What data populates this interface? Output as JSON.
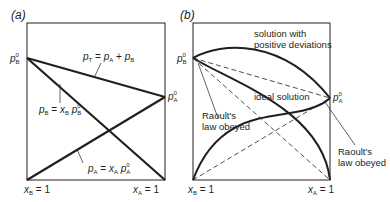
{
  "panels": [
    {
      "id": "a",
      "label": "(a)",
      "left_axis_label": {
        "symbol": "p",
        "sub": "B",
        "sup": "0"
      },
      "right_axis_label": {
        "symbol": "p",
        "sub": "A",
        "sup": "0"
      },
      "x_left_label": {
        "var": "x",
        "sub": "B",
        "rest": " = 1"
      },
      "x_right_label": {
        "var": "x",
        "sub": "A",
        "rest": " = 1"
      },
      "annotations": {
        "total": "p_T = p_A + p_B",
        "b_line": "p_B = x_B p_B^0",
        "a_line": "p_A = x_A p_A^0"
      }
    },
    {
      "id": "b",
      "label": "(b)",
      "left_axis_label": {
        "symbol": "p",
        "sub": "B",
        "sup": "0"
      },
      "right_axis_label": {
        "symbol": "p",
        "sub": "A",
        "sup": "0"
      },
      "x_left_label": {
        "var": "x",
        "sub": "B",
        "rest": " = 1"
      },
      "x_right_label": {
        "var": "x",
        "sub": "A",
        "rest": " = 1"
      },
      "annotations": {
        "positive_line1": "solution with",
        "positive_line2": "positive deviations",
        "ideal": "ideal solution",
        "raoult_left_line1": "Raoult's",
        "raoult_left_line2": "law obeyed",
        "raoult_right_line1": "Raoult's",
        "raoult_right_line2": "law obeyed"
      }
    }
  ],
  "text": {
    "eq_eq": " = ",
    "eq_plus": " + ",
    "p": "p",
    "x": "x",
    "T": "T",
    "A": "A",
    "B": "B",
    "zero": "0"
  },
  "colors": {
    "ink": "#231f20",
    "background": "#ffffff"
  }
}
